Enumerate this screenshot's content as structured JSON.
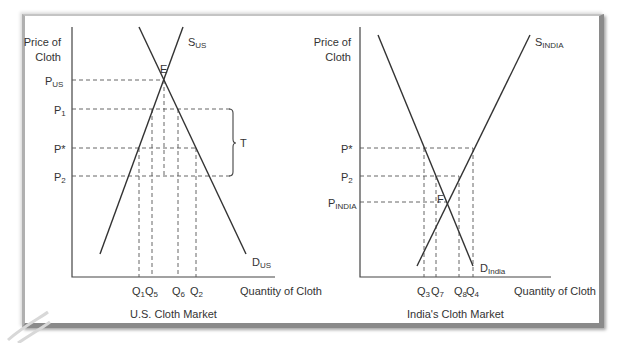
{
  "left_panel": {
    "title": "U.S. Cloth Market",
    "y_axis_label_line1": "Price of",
    "y_axis_label_line2": "Cloth",
    "x_axis_label": "Quantity of Cloth",
    "price_labels": [
      {
        "main": "P",
        "sub": "US"
      },
      {
        "main": "P",
        "sub": "1"
      },
      {
        "main": "P*",
        "sub": ""
      },
      {
        "main": "P",
        "sub": "2"
      }
    ],
    "quantity_labels": [
      {
        "main": "Q",
        "sub": "1"
      },
      {
        "main": "Q",
        "sub": "5"
      },
      {
        "main": "Q",
        "sub": "6"
      },
      {
        "main": "Q",
        "sub": "2"
      }
    ],
    "supply_label": {
      "main": "S",
      "sub": "US"
    },
    "demand_label": {
      "main": "D",
      "sub": "US"
    },
    "equilibrium_label": "E",
    "tariff_label": "T"
  },
  "right_panel": {
    "title": "India's Cloth Market",
    "y_axis_label_line1": "Price of",
    "y_axis_label_line2": "Cloth",
    "x_axis_label": "Quantity of Cloth",
    "price_labels": [
      {
        "main": "P*",
        "sub": ""
      },
      {
        "main": "P",
        "sub": "2"
      },
      {
        "main": "P",
        "sub": "INDIA"
      }
    ],
    "quantity_labels": [
      {
        "main": "Q",
        "sub": "3"
      },
      {
        "main": "Q",
        "sub": "7"
      },
      {
        "main": "Q",
        "sub": "8"
      },
      {
        "main": "Q",
        "sub": "4"
      }
    ],
    "supply_label": {
      "main": "S",
      "sub": "INDIA"
    },
    "demand_label": {
      "main": "D",
      "sub": "India"
    },
    "equilibrium_label": "F"
  },
  "colors": {
    "line": "#333333",
    "dash": "#555555",
    "frame_shadow": "#8a8a8a"
  }
}
